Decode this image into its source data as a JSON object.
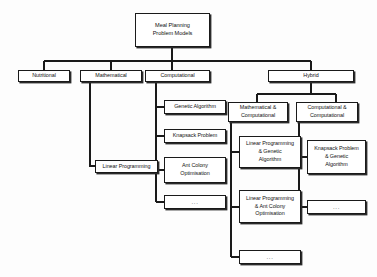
{
  "diagram": {
    "title": "Meal Planning Problem Models",
    "type": "hierarchical-tree",
    "background_color": "#fdfdfd",
    "box_border_color": "#1a1a1a",
    "box_fill_color": "#ffffff",
    "connector_color": "#1a1a1a",
    "ellipsis_text": "..."
  },
  "nodes": {
    "root": {
      "label": "Meal Planning\nProblem Models"
    },
    "level1": [
      {
        "id": "nutritional",
        "label": "Nutritional"
      },
      {
        "id": "mathematical",
        "label": "Mathematical"
      },
      {
        "id": "computational",
        "label": "Computational"
      },
      {
        "id": "hybrid",
        "label": "Hybrid"
      }
    ],
    "mathematical_children": [
      {
        "id": "linear-programming",
        "label": "Linear Programming"
      }
    ],
    "computational_children": [
      {
        "id": "genetic-algorithm",
        "label": "Genetic Algorithm"
      },
      {
        "id": "knapsack-problem",
        "label": "Knapsack Problem"
      },
      {
        "id": "ant-colony-optimisation",
        "label": "Ant Colony\nOptimisation"
      },
      {
        "id": "computational-more",
        "label": "..."
      }
    ],
    "hybrid_children": [
      {
        "id": "mathematical-computational",
        "label": "Mathematical &\nComputational"
      },
      {
        "id": "computational-computational",
        "label": "Computational &\nComputational"
      }
    ],
    "mathematical_computational_children": [
      {
        "id": "lp-genetic",
        "label": "Linear Programming\n& Genetic\nAlgorithm"
      },
      {
        "id": "lp-ant-colony",
        "label": "Linear Programming\n& Ant Colony\nOptimisation"
      },
      {
        "id": "math-comp-more",
        "label": "..."
      }
    ],
    "computational_computational_children": [
      {
        "id": "knapsack-genetic",
        "label": "Knapsack Problem\n& Genetic\nAlgorithm"
      },
      {
        "id": "comp-comp-more",
        "label": "..."
      }
    ]
  }
}
